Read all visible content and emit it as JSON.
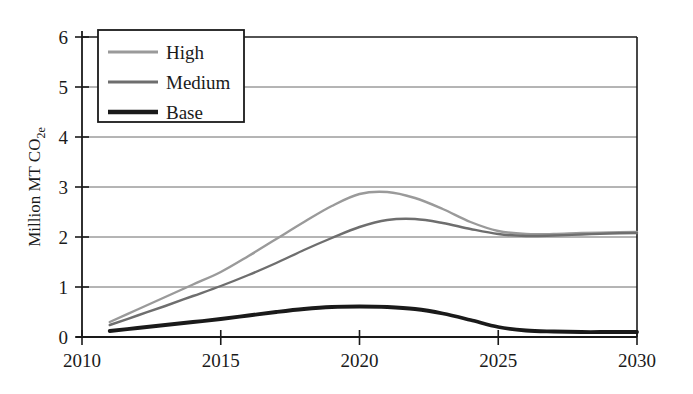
{
  "chart_data": {
    "type": "line",
    "title": "",
    "xlabel": "",
    "ylabel": "Million MT CO2e",
    "ylabel_main": "Million MT CO",
    "ylabel_sub": "2e",
    "xlim": [
      2010,
      2030
    ],
    "ylim": [
      0,
      6
    ],
    "grid": true,
    "grid_axis": "y",
    "legend_position": "top-left",
    "xticks": [
      "2010",
      "2015",
      "2020",
      "2025",
      "2030"
    ],
    "xtick_values": [
      2010,
      2015,
      2020,
      2025,
      2030
    ],
    "yticks": [
      "0",
      "1",
      "2",
      "3",
      "4",
      "5",
      "6"
    ],
    "ytick_values": [
      0,
      1,
      2,
      3,
      4,
      5,
      6
    ],
    "x": [
      2011,
      2012,
      2013,
      2014,
      2015,
      2016,
      2017,
      2018,
      2019,
      2020,
      2021,
      2022,
      2023,
      2024,
      2025,
      2026,
      2027,
      2028,
      2029,
      2030
    ],
    "series": [
      {
        "name": "High",
        "color": "#9a9a9a",
        "width": 2.4,
        "values": [
          0.3,
          0.55,
          0.8,
          1.05,
          1.3,
          1.62,
          1.96,
          2.3,
          2.62,
          2.86,
          2.9,
          2.78,
          2.56,
          2.3,
          2.12,
          2.06,
          2.06,
          2.08,
          2.09,
          2.1
        ]
      },
      {
        "name": "Medium",
        "color": "#6e6e6e",
        "width": 2.4,
        "values": [
          0.24,
          0.43,
          0.62,
          0.82,
          1.02,
          1.24,
          1.48,
          1.74,
          1.98,
          2.2,
          2.34,
          2.36,
          2.28,
          2.16,
          2.06,
          2.02,
          2.03,
          2.05,
          2.07,
          2.08
        ]
      },
      {
        "name": "Base",
        "color": "#1a1a1a",
        "width": 3.8,
        "values": [
          0.12,
          0.18,
          0.24,
          0.3,
          0.36,
          0.43,
          0.5,
          0.56,
          0.6,
          0.61,
          0.6,
          0.56,
          0.47,
          0.34,
          0.2,
          0.13,
          0.11,
          0.1,
          0.1,
          0.1
        ]
      }
    ],
    "annotations": [
      {
        "label": "High peak",
        "x": 2021,
        "y": 2.9
      },
      {
        "label": "Medium peak",
        "x": 2022,
        "y": 2.36
      },
      {
        "label": "Base peak",
        "x": 2020,
        "y": 0.61
      },
      {
        "label": "High/Medium crossover",
        "x": 2017.5,
        "y": 2.0
      }
    ]
  },
  "legend": {
    "entries": [
      {
        "label": "High"
      },
      {
        "label": "Medium"
      },
      {
        "label": "Base"
      }
    ]
  },
  "axes": {
    "y_axis_label_main": "Million MT CO",
    "y_axis_label_sub": "2e"
  }
}
